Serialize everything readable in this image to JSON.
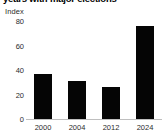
{
  "chart_data": {
    "type": "bar",
    "title": "years with major elections",
    "subtitle": "",
    "xlabel": "",
    "ylabel": "Index",
    "categories": [
      "2000",
      "2004",
      "2012",
      "2024"
    ],
    "values": [
      37,
      31,
      26,
      76
    ],
    "series": [
      {
        "name": "Index",
        "values": [
          37,
          31,
          26,
          76
        ]
      }
    ],
    "ylim": [
      0,
      80
    ],
    "yticks": [
      "0",
      "20",
      "40",
      "60",
      "80"
    ],
    "ytick_values": [
      0,
      20,
      40,
      60,
      80
    ],
    "grid": false,
    "legend": "none",
    "bar_color": "#050505",
    "axis_color": "#bfbfbf",
    "text_color": "#2b2b2b"
  },
  "labels": {
    "unit": "Index"
  }
}
